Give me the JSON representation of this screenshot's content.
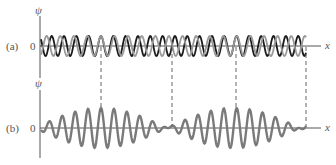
{
  "figure": {
    "panel_a": {
      "label": "(a)",
      "y_axis_label": "ψ",
      "zero_label": "0",
      "x_axis_label": "x",
      "waves": [
        {
          "name": "wave-1",
          "color": "#1a1a1a",
          "cycles": 21.5,
          "amplitude": 10
        },
        {
          "name": "wave-2",
          "color": "#999999",
          "cycles": 19.5,
          "amplitude": 10
        }
      ]
    },
    "panel_b": {
      "label": "(b)",
      "y_axis_label": "ψ",
      "zero_label": "0",
      "x_axis_label": "x",
      "wave": {
        "name": "superposition",
        "color": "#7a7a7a",
        "amplitude": 20
      }
    },
    "dashed_lines_x": [
      101,
      172,
      236,
      306
    ],
    "colors": {
      "axis": "#555555",
      "dash": "#666666",
      "dark_wave": "#1a1a1a",
      "light_wave": "#999999",
      "sum_wave": "#7a7a7a"
    }
  }
}
